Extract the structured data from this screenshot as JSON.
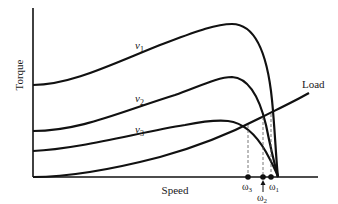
{
  "diagram": {
    "y_axis_label": "Torque",
    "x_axis_label": "Speed",
    "colors": {
      "line": "#111111",
      "dashed": "#555555",
      "background": "#ffffff"
    },
    "curves": [
      {
        "id": "v1",
        "label": "v",
        "subscript": "1"
      },
      {
        "id": "v2",
        "label": "v",
        "subscript": "2"
      },
      {
        "id": "v3",
        "label": "v",
        "subscript": "3"
      },
      {
        "id": "load",
        "label": "Load"
      }
    ],
    "operating_points": [
      {
        "id": "omega3",
        "label": "ω",
        "subscript": "3"
      },
      {
        "id": "omega2",
        "label": "ω",
        "subscript": "2"
      },
      {
        "id": "omega1",
        "label": "ω",
        "subscript": "1"
      }
    ]
  }
}
